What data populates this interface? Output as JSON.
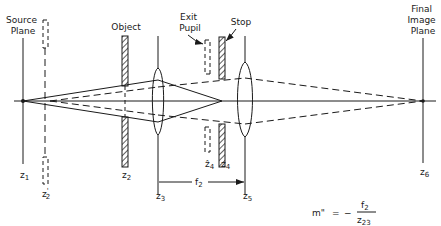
{
  "labels": {
    "source_plane": [
      "Source",
      "Plane"
    ],
    "object": "Object",
    "exit_pupil": [
      "Exit",
      "Pupil"
    ],
    "stop": "Stop",
    "final_image_plane": [
      "Final",
      "Image",
      "Plane"
    ]
  },
  "positions": {
    "z1": {
      "base": "z",
      "sub": "1"
    },
    "z2p": {
      "base": "z",
      "sub": "2",
      "mark": "'"
    },
    "z2": {
      "base": "z",
      "sub": "2"
    },
    "z3": {
      "base": "z",
      "sub": "3"
    },
    "z4hat": {
      "base": "ẑ",
      "sub": "4"
    },
    "z4": {
      "base": "z",
      "sub": "4"
    },
    "z5": {
      "base": "z",
      "sub": "5"
    },
    "z6": {
      "base": "z",
      "sub": "6"
    }
  },
  "focal_length": {
    "base": "f",
    "sub": "2"
  },
  "equation": {
    "lhs": "m\"",
    "equals": "=",
    "minus": "−",
    "numerator": {
      "base": "f",
      "sub": "2"
    },
    "denominator": {
      "base": "z",
      "sub": "23"
    }
  },
  "colors": {
    "ink": "#1a1a1a",
    "background": "#ffffff"
  }
}
